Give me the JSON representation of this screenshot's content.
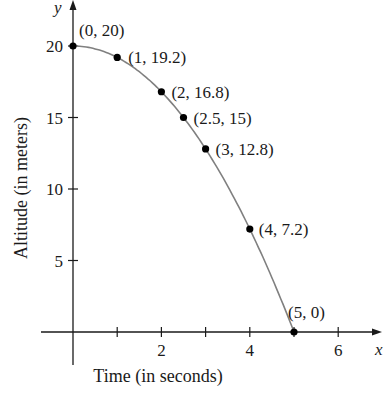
{
  "chart_data": {
    "type": "line",
    "title": "",
    "xlabel": "Time (in seconds)",
    "ylabel": "Altitude (in meters)",
    "x_axis_letter": "x",
    "y_axis_letter": "y",
    "x_ticks": [
      1,
      2,
      3,
      4,
      5,
      6
    ],
    "x_tick_labels": [
      "2",
      "4",
      "6"
    ],
    "y_ticks": [
      5,
      10,
      15,
      20
    ],
    "y_tick_labels": [
      "5",
      "10",
      "15",
      "20"
    ],
    "xlim": [
      -0.7,
      6.9
    ],
    "ylim": [
      0,
      22.5
    ],
    "grid": false,
    "curve": "y = 20 - 0.8x^2",
    "series": [
      {
        "name": "Altitude",
        "points": [
          {
            "x": 0,
            "y": 20,
            "label": "(0, 20)"
          },
          {
            "x": 1,
            "y": 19.2,
            "label": "(1, 19.2)"
          },
          {
            "x": 2,
            "y": 16.8,
            "label": "(2, 16.8)"
          },
          {
            "x": 2.5,
            "y": 15,
            "label": "(2.5, 15)"
          },
          {
            "x": 3,
            "y": 12.8,
            "label": "(3, 12.8)"
          },
          {
            "x": 4,
            "y": 7.2,
            "label": "(4, 7.2)"
          },
          {
            "x": 5,
            "y": 0,
            "label": "(5, 0)"
          }
        ]
      }
    ],
    "colors": {
      "curve": "#808080",
      "points": "#000000",
      "axes": "#1a1a1a"
    }
  }
}
